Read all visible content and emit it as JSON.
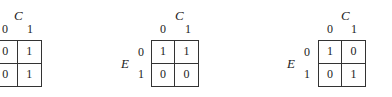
{
  "kmaps": [
    {
      "column_variable": "C",
      "row_variable": "",
      "column_labels": [
        "0",
        "1"
      ],
      "row_labels": [
        "",
        ""
      ],
      "cells": [
        [
          "0",
          "1"
        ],
        [
          "0",
          "1"
        ]
      ]
    },
    {
      "column_variable": "C",
      "row_variable": "E",
      "column_labels": [
        "0",
        "1"
      ],
      "row_labels": [
        "0",
        "1"
      ],
      "cells": [
        [
          "1",
          "1"
        ],
        [
          "0",
          "0"
        ]
      ]
    },
    {
      "column_variable": "C",
      "row_variable": "E",
      "column_labels": [
        "0",
        "1"
      ],
      "row_labels": [
        "0",
        "1"
      ],
      "cells": [
        [
          "1",
          "0"
        ],
        [
          "0",
          "1"
        ]
      ]
    }
  ]
}
